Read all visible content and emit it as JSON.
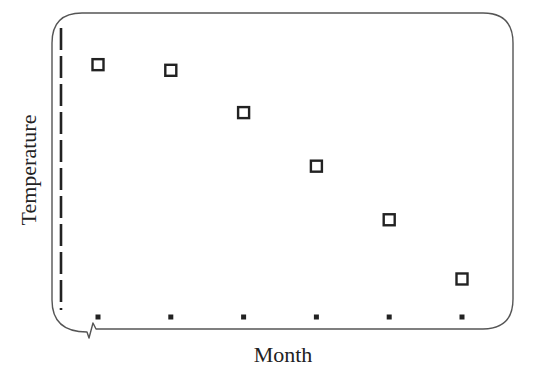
{
  "chart_data": {
    "type": "scatter",
    "title": "",
    "xlabel": "Month",
    "ylabel": "Temperature",
    "categories": [
      "",
      "",
      "",
      "",
      "",
      ""
    ],
    "x": [
      1,
      2,
      3,
      4,
      5,
      6
    ],
    "values": [
      0.87,
      0.85,
      0.7,
      0.51,
      0.32,
      0.11
    ],
    "value_scale": "relative (0 = bottom of axis, 1 = top); no tick labels shown",
    "ylim": [
      0,
      1
    ],
    "grid": false,
    "legend": null,
    "marker": "open-square",
    "annotations": [
      "x-axis break symbol near origin",
      "dashed y-axis line"
    ]
  },
  "colors": {
    "frame": "#555555",
    "marker": "#222222",
    "text": "#222222",
    "background": "#ffffff"
  }
}
